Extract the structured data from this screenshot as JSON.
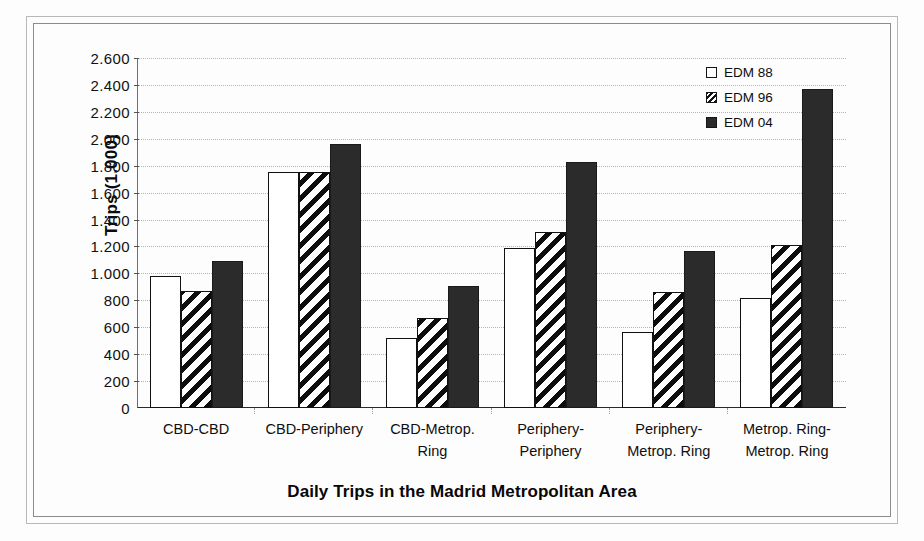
{
  "chart_data": {
    "type": "bar",
    "title": "Daily Trips in the Madrid Metropolitan Area",
    "xlabel": "",
    "ylabel": "Trips (1.000)",
    "ylim": [
      0,
      2600
    ],
    "grid": true,
    "legend_position": "top-right",
    "categories": [
      "CBD-CBD",
      "CBD-Periphery",
      "CBD-Metrop. Ring",
      "Periphery-Periphery",
      "Periphery-Metrop. Ring",
      "Metrop. Ring-Metrop. Ring"
    ],
    "category_lines": [
      [
        "CBD-CBD"
      ],
      [
        "CBD-Periphery"
      ],
      [
        "CBD-Metrop.",
        "Ring"
      ],
      [
        "Periphery-",
        "Periphery"
      ],
      [
        "Periphery-",
        "Metrop. Ring"
      ],
      [
        "Metrop. Ring-",
        "Metrop. Ring"
      ]
    ],
    "ytick_labels": [
      "0",
      "200",
      "400",
      "600",
      "800",
      "1.000",
      "1.200",
      "1.400",
      "1.600",
      "1.800",
      "2.000",
      "2.200",
      "2.400",
      "2.600"
    ],
    "ytick_values": [
      0,
      200,
      400,
      600,
      800,
      1000,
      1200,
      1400,
      1600,
      1800,
      2000,
      2200,
      2400,
      2600
    ],
    "series": [
      {
        "name": "EDM 88",
        "style": "white",
        "color": "#ffffff",
        "values": [
          980,
          1755,
          520,
          1190,
          565,
          820
        ]
      },
      {
        "name": "EDM 96",
        "style": "hatched",
        "color": "#ffffff",
        "values": [
          870,
          1755,
          665,
          1310,
          860,
          1210
        ]
      },
      {
        "name": "EDM 04",
        "style": "black",
        "color": "#2b2b2b",
        "values": [
          1090,
          1960,
          910,
          1830,
          1170,
          2370
        ]
      }
    ]
  },
  "legend": {
    "items": [
      {
        "label": "EDM 88"
      },
      {
        "label": "EDM 96"
      },
      {
        "label": "EDM 04"
      }
    ]
  }
}
